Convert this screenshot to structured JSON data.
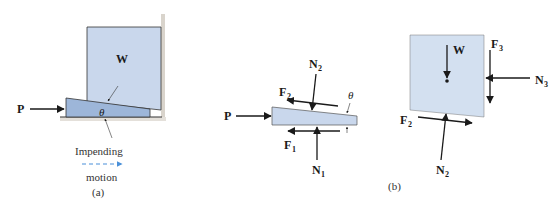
{
  "figure": {
    "part_a": {
      "caption": "(a)",
      "block_label": "W",
      "force_label": "P",
      "angle_label": "θ",
      "motion_label_top": "Impending",
      "motion_label_bottom": "motion"
    },
    "part_b": {
      "caption": "(b)",
      "wedge": {
        "force_P": "P",
        "normal_top": "N",
        "normal_top_sub": "2",
        "friction_top": "F",
        "friction_top_sub": "2",
        "normal_bottom": "N",
        "normal_bottom_sub": "1",
        "friction_bottom": "F",
        "friction_bottom_sub": "1",
        "angle_label": "θ"
      },
      "block": {
        "weight": "W",
        "friction_wall": "F",
        "friction_wall_sub": "3",
        "normal_wall": "N",
        "normal_wall_sub": "3",
        "friction_bottom": "F",
        "friction_bottom_sub": "2",
        "normal_bottom": "N",
        "normal_bottom_sub": "2"
      }
    },
    "colors": {
      "fill_light": "#c9d7ec",
      "fill_wedge": "#9db6d9",
      "outline": "#333333",
      "arrow": "#1a1a1a",
      "motion_arrow": "#4a90d9",
      "wall": "#d9d4cc"
    }
  }
}
